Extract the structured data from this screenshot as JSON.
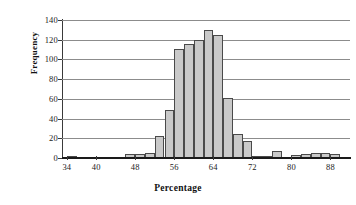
{
  "chart_data": {
    "type": "bar",
    "title": "",
    "xlabel": "Percentage",
    "ylabel": "Frequency",
    "xlim": [
      33,
      92
    ],
    "ylim": [
      0,
      140
    ],
    "bin_width": 2,
    "grid": true,
    "legend": "none",
    "y_ticks": [
      0,
      20,
      40,
      60,
      80,
      100,
      120,
      140
    ],
    "x_ticks": [
      34,
      40,
      48,
      56,
      64,
      72,
      80,
      88
    ],
    "bar_fill_color": "#c9c9c9",
    "bar_edge_color": "#4a4a4a",
    "categories": [
      34,
      36,
      38,
      40,
      42,
      44,
      46,
      48,
      50,
      52,
      54,
      56,
      58,
      60,
      62,
      64,
      66,
      68,
      70,
      72,
      74,
      76,
      78,
      80,
      82,
      84,
      86,
      88,
      90
    ],
    "values": [
      2,
      0,
      0,
      0,
      0,
      0,
      4,
      4,
      5,
      22,
      49,
      111,
      116,
      120,
      130,
      125,
      61,
      24,
      17,
      2,
      2,
      7,
      0,
      3,
      4,
      5,
      5,
      4,
      0
    ]
  }
}
